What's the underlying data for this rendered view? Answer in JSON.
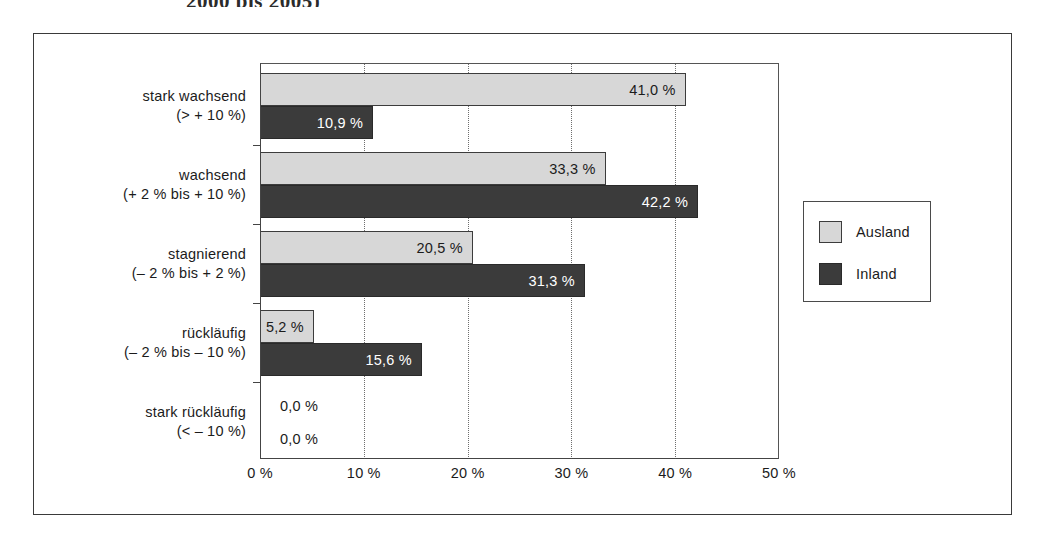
{
  "figure": {
    "title_remnant": "2000 bis 2005)"
  },
  "chart_data": {
    "type": "bar",
    "orientation": "horizontal",
    "title": "",
    "xlabel": "",
    "ylabel": "",
    "xlim": [
      0,
      50
    ],
    "grid": "vertical dotted gridlines at 10 %, 20 %, 30 %, 40 %",
    "xticks": [
      "0 %",
      "10 %",
      "20 %",
      "30 %",
      "40 %",
      "50 %"
    ],
    "xtick_values": [
      0,
      10,
      20,
      30,
      40,
      50
    ],
    "legend_position": "right",
    "categories": [
      {
        "line1": "stark wachsend",
        "line2": "(> + 10 %)"
      },
      {
        "line1": "wachsend",
        "line2": "(+ 2 % bis + 10 %)"
      },
      {
        "line1": "stagnierend",
        "line2": "(– 2 % bis + 2 %)"
      },
      {
        "line1": "rückläufig",
        "line2": "(– 2 % bis – 10 %)"
      },
      {
        "line1": "stark rückläufig",
        "line2": "(< – 10 %)"
      }
    ],
    "series": [
      {
        "name": "Ausland",
        "color": "#d7d7d7",
        "values": [
          41.0,
          33.3,
          20.5,
          5.2,
          0.0
        ],
        "labels": [
          "41,0 %",
          "33,3 %",
          "20,5 %",
          "5,2 %",
          "0,0 %"
        ]
      },
      {
        "name": "Inland",
        "color": "#3b3b3b",
        "values": [
          10.9,
          42.2,
          31.3,
          15.6,
          0.0
        ],
        "labels": [
          "10,9 %",
          "42,2 %",
          "31,3 %",
          "15,6 %",
          "0,0 %"
        ]
      }
    ]
  },
  "legend": {
    "entries": [
      {
        "label": "Ausland",
        "color": "#d7d7d7"
      },
      {
        "label": "Inland",
        "color": "#3b3b3b"
      }
    ]
  }
}
